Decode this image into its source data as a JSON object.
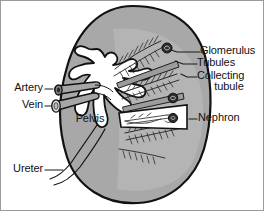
{
  "figure": {
    "palette": {
      "cortex_fill": "#a8a8a8",
      "medulla_fill": "#bdbdbd",
      "pelvis_fill": "#ffffff",
      "outline": "#111111",
      "vessel_fill": "#a0a0a0",
      "glomerulus_fill": "#2a2a2a",
      "leader_line": "#1a1a1a",
      "frame_border": "#9a9a9a",
      "background": "#ffffff",
      "text": "#111111"
    }
  },
  "labels": {
    "glomerulus": "Glomerulus",
    "tubules": "Tubules",
    "collecting_tubule_line1": "Collecting",
    "collecting_tubule_line2": "tubule",
    "nephron": "Nephron",
    "artery": "Artery",
    "vein": "Vein",
    "pelvis": "Pelvis",
    "ureter": "Ureter"
  },
  "structures": [
    {
      "name": "renal-cortex",
      "label": "",
      "side": "whole"
    },
    {
      "name": "renal-medulla-pyramids",
      "label": "",
      "side": "right"
    },
    {
      "name": "renal-pelvis",
      "label": "Pelvis",
      "side": "center"
    },
    {
      "name": "renal-artery",
      "label": "Artery",
      "side": "left"
    },
    {
      "name": "renal-vein",
      "label": "Vein",
      "side": "left"
    },
    {
      "name": "ureter",
      "label": "Ureter",
      "side": "left"
    },
    {
      "name": "glomerulus",
      "label": "Glomerulus",
      "side": "right"
    },
    {
      "name": "tubules",
      "label": "Tubules",
      "side": "right"
    },
    {
      "name": "collecting-tubule",
      "label": "Collecting tubule",
      "side": "right"
    },
    {
      "name": "nephron",
      "label": "Nephron",
      "side": "right"
    }
  ]
}
